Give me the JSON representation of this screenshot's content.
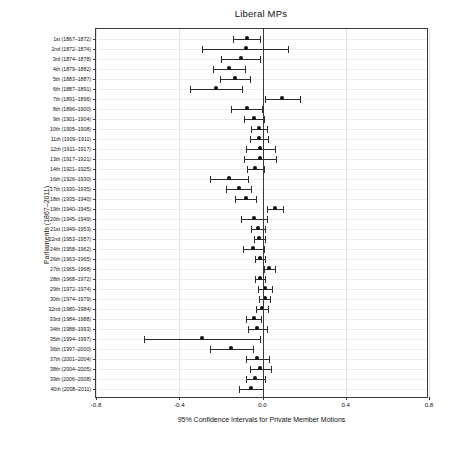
{
  "chart_data": {
    "type": "scatter",
    "title": "Liberal MPs",
    "xlabel": "95% Confidence Intervals for Private Member Motions",
    "ylabel": "Parliaments (1867–2011)",
    "xlim": [
      -0.8,
      0.8
    ],
    "xticks": [
      -0.8,
      -0.4,
      0.0,
      0.4,
      0.8
    ],
    "xticklabels": [
      "-0.8",
      "-0.4",
      "0.0",
      "0.4",
      "0.8"
    ],
    "grid": true,
    "legend": "none",
    "reference_line": 0.0,
    "categories": [
      "1st (1867–1872)",
      "2nd (1872–1874)",
      "3rd (1874–1878)",
      "4th (1879–1882)",
      "5th (1883–1887)",
      "6th (1887–1891)",
      "7th (1891–1896)",
      "8th (1896–1900)",
      "9th (1901–1904)",
      "10th (1905–1908)",
      "11th (1909–1911)",
      "12th (1911–1917)",
      "13th (1917–1921)",
      "14th (1921–1925)",
      "16th (1926–1930)",
      "17th (1930–1935)",
      "18th (1935–1940)",
      "19th (1940–1945)",
      "20th (1945–1949)",
      "21st (1949–1953)",
      "22nd (1953–1957)",
      "24th (1958–1962)",
      "26th (1963–1965)",
      "27th (1965–1968)",
      "28th (1968–1972)",
      "29th (1972–1974)",
      "30th (1974–1979)",
      "32nd (1980–1984)",
      "33rd (1984–1988)",
      "34th (1988–1993)",
      "35th (1994–1997)",
      "36th (1997–2000)",
      "37th (2001–2004)",
      "38th (2004–2005)",
      "39th (2006–2008)",
      "40th (2008–2011)"
    ],
    "estimates": [
      -0.075,
      -0.08,
      -0.105,
      -0.163,
      -0.132,
      -0.225,
      0.093,
      -0.075,
      -0.041,
      -0.017,
      -0.015,
      -0.01,
      -0.012,
      -0.035,
      -0.16,
      -0.115,
      -0.08,
      0.06,
      -0.04,
      -0.02,
      -0.015,
      -0.045,
      -0.012,
      0.033,
      -0.012,
      0.013,
      0.01,
      -0.003,
      -0.043,
      -0.025,
      -0.29,
      -0.15,
      -0.025,
      -0.01,
      -0.035,
      -0.055
    ],
    "ci_low": [
      -0.14,
      -0.29,
      -0.198,
      -0.24,
      -0.205,
      -0.35,
      0.01,
      -0.15,
      -0.09,
      -0.055,
      -0.058,
      -0.08,
      -0.09,
      -0.075,
      -0.25,
      -0.175,
      -0.13,
      0.02,
      -0.105,
      -0.055,
      -0.04,
      -0.095,
      -0.035,
      0.005,
      -0.035,
      -0.02,
      -0.018,
      -0.03,
      -0.08,
      -0.07,
      -0.57,
      -0.25,
      -0.08,
      -0.06,
      -0.08,
      -0.115
    ],
    "ci_high": [
      -0.012,
      0.122,
      -0.013,
      -0.085,
      -0.06,
      -0.098,
      0.18,
      -0.003,
      0.005,
      0.02,
      0.028,
      0.058,
      0.065,
      0.005,
      -0.07,
      -0.055,
      -0.03,
      0.1,
      0.023,
      0.013,
      0.01,
      0.005,
      0.01,
      0.062,
      0.01,
      0.046,
      0.038,
      0.025,
      -0.008,
      0.02,
      -0.01,
      -0.048,
      0.03,
      0.04,
      0.01,
      0.002
    ]
  },
  "colors": {
    "marker": "#111111",
    "interval": "#2b2b2b",
    "axis": "#3a3a3a",
    "grid": "#e2e2e6",
    "background": "#ffffff"
  }
}
